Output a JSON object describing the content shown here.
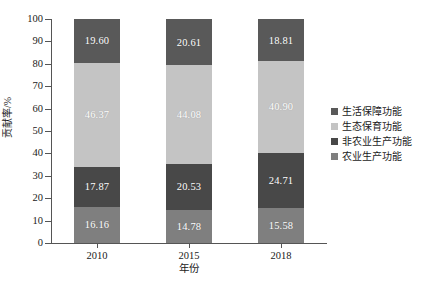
{
  "chart_data": {
    "type": "bar",
    "subtype": "stacked-bar-percent",
    "title": "",
    "xlabel": "年份",
    "ylabel": "贡献率/%",
    "categories": [
      "2010",
      "2015",
      "2018"
    ],
    "ylim": [
      0,
      100
    ],
    "yticks": [
      "0",
      "10",
      "20",
      "30",
      "40",
      "50",
      "60",
      "70",
      "80",
      "90",
      "100"
    ],
    "grid": false,
    "legend_position": "right",
    "series": [
      {
        "name": "农业生产功能",
        "color": "#7f7f7f",
        "values": [
          16.16,
          14.78,
          15.58
        ],
        "labels": [
          "16.16",
          "14.78",
          "15.58"
        ]
      },
      {
        "name": "非农业生产功能",
        "color": "#484848",
        "values": [
          17.87,
          20.53,
          24.71
        ],
        "labels": [
          "17.87",
          "20.53",
          "24.71"
        ]
      },
      {
        "name": "生态保育功能",
        "color": "#c4c4c4",
        "values": [
          46.37,
          44.08,
          40.9
        ],
        "labels": [
          "46.37",
          "44.08",
          "40.90"
        ]
      },
      {
        "name": "生活保障功能",
        "color": "#595959",
        "values": [
          19.6,
          20.61,
          18.81
        ],
        "labels": [
          "19.60",
          "20.61",
          "18.81"
        ]
      }
    ],
    "legend_order": [
      "生活保障功能",
      "生态保育功能",
      "非农业生产功能",
      "农业生产功能"
    ]
  },
  "axes": {
    "y_title": "贡献率/%",
    "x_title": "年份",
    "y_ticks": [
      "100",
      "90",
      "80",
      "70",
      "60",
      "50",
      "40",
      "30",
      "20",
      "10",
      "0"
    ],
    "x_ticks": [
      "2010",
      "2015",
      "2018"
    ]
  },
  "legend": {
    "items": [
      {
        "label": "生活保障功能",
        "color": "#595959"
      },
      {
        "label": "生态保育功能",
        "color": "#c4c4c4"
      },
      {
        "label": "非农业生产功能",
        "color": "#484848"
      },
      {
        "label": "农业生产功能",
        "color": "#7f7f7f"
      }
    ]
  },
  "bars": [
    {
      "category": "2010",
      "segments": [
        {
          "name": "生活保障功能",
          "value": 19.6,
          "label": "19.60",
          "color": "#595959"
        },
        {
          "name": "生态保育功能",
          "value": 46.37,
          "label": "46.37",
          "color": "#c4c4c4"
        },
        {
          "name": "非农业生产功能",
          "value": 17.87,
          "label": "17.87",
          "color": "#484848"
        },
        {
          "name": "农业生产功能",
          "value": 16.16,
          "label": "16.16",
          "color": "#7f7f7f"
        }
      ]
    },
    {
      "category": "2015",
      "segments": [
        {
          "name": "生活保障功能",
          "value": 20.61,
          "label": "20.61",
          "color": "#595959"
        },
        {
          "name": "生态保育功能",
          "value": 44.08,
          "label": "44.08",
          "color": "#c4c4c4"
        },
        {
          "name": "非农业生产功能",
          "value": 20.53,
          "label": "20.53",
          "color": "#484848"
        },
        {
          "name": "农业生产功能",
          "value": 14.78,
          "label": "14.78",
          "color": "#7f7f7f"
        }
      ]
    },
    {
      "category": "2018",
      "segments": [
        {
          "name": "生活保障功能",
          "value": 18.81,
          "label": "18.81",
          "color": "#595959"
        },
        {
          "name": "生态保育功能",
          "value": 40.9,
          "label": "40.90",
          "color": "#c4c4c4"
        },
        {
          "name": "非农业生产功能",
          "value": 24.71,
          "label": "24.71",
          "color": "#484848"
        },
        {
          "name": "农业生产功能",
          "value": 15.58,
          "label": "15.58",
          "color": "#7f7f7f"
        }
      ]
    }
  ]
}
